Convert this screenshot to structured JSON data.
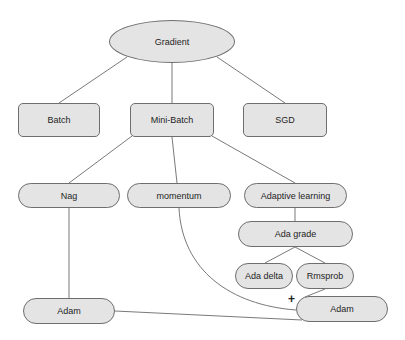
{
  "diagram": {
    "root": {
      "id": "gradient",
      "label": "Gradient",
      "shape": "ellipse"
    },
    "level1": [
      {
        "id": "batch",
        "label": "Batch",
        "shape": "rounded-rect"
      },
      {
        "id": "mini-batch",
        "label": "Mini-Batch",
        "shape": "rounded-rect"
      },
      {
        "id": "sgd",
        "label": "SGD",
        "shape": "rounded-rect"
      }
    ],
    "level2": [
      {
        "id": "nag",
        "label": "Nag",
        "shape": "pill"
      },
      {
        "id": "momentum",
        "label": "momentum",
        "shape": "pill"
      },
      {
        "id": "adaptive-learning",
        "label": "Adaptive learning",
        "shape": "pill"
      }
    ],
    "level3": [
      {
        "id": "ada-grade",
        "label": "Ada grade",
        "shape": "pill"
      }
    ],
    "level4": [
      {
        "id": "ada-delta",
        "label": "Ada delta",
        "shape": "pill"
      },
      {
        "id": "rmsprob",
        "label": "Rmsprob",
        "shape": "pill"
      }
    ],
    "leaves": [
      {
        "id": "adam-left",
        "label": "Adam",
        "shape": "pill"
      },
      {
        "id": "adam-right",
        "label": "Adam",
        "shape": "pill"
      }
    ],
    "plus_symbol": "+",
    "edges": [
      [
        "gradient",
        "batch"
      ],
      [
        "gradient",
        "mini-batch"
      ],
      [
        "gradient",
        "sgd"
      ],
      [
        "mini-batch",
        "nag"
      ],
      [
        "mini-batch",
        "momentum"
      ],
      [
        "mini-batch",
        "adaptive-learning"
      ],
      [
        "adaptive-learning",
        "ada-grade"
      ],
      [
        "ada-grade",
        "ada-delta"
      ],
      [
        "ada-grade",
        "rmsprob"
      ],
      [
        "nag",
        "adam-left"
      ],
      [
        "momentum",
        "adam-right"
      ],
      [
        "rmsprob",
        "adam-right"
      ],
      [
        "adam-left",
        "adam-right"
      ]
    ],
    "colors": {
      "node_fill": "#e4e4e4",
      "node_border": "#6e6e6e",
      "edge": "#6a6a6a"
    }
  }
}
